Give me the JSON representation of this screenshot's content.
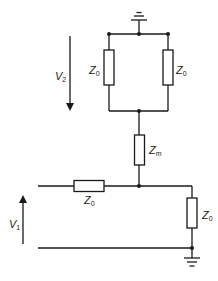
{
  "diagram": {
    "type": "circuit",
    "labels": {
      "v2": {
        "main": "V",
        "sub": "2"
      },
      "v1": {
        "main": "V",
        "sub": "1"
      },
      "z_top_left": {
        "main": "Z",
        "sub": "0"
      },
      "z_top_right": {
        "main": "Z",
        "sub": "0"
      },
      "z_m": {
        "main": "Z",
        "sub": "m"
      },
      "z_series": {
        "main": "Z",
        "sub": "0"
      },
      "z_shunt": {
        "main": "Z",
        "sub": "0"
      }
    },
    "colors": {
      "line": "#1a1a1a",
      "background": "#ffffff"
    }
  }
}
